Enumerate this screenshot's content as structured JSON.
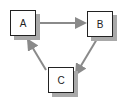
{
  "diagram": {
    "type": "directed-cycle",
    "nodes": [
      {
        "id": "A",
        "label": "A",
        "x": 10,
        "y": 10
      },
      {
        "id": "B",
        "label": "B",
        "x": 87,
        "y": 11
      },
      {
        "id": "C",
        "label": "C",
        "x": 48,
        "y": 67
      }
    ],
    "edges": [
      {
        "from": "A",
        "to": "B"
      },
      {
        "from": "B",
        "to": "C"
      },
      {
        "from": "C",
        "to": "A"
      }
    ],
    "colors": {
      "edge": "#8a8a8a",
      "shadow": "#a9a9a9",
      "border": "#222222"
    }
  }
}
